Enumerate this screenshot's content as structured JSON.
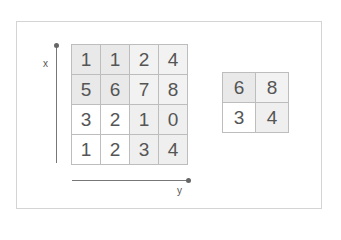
{
  "diagram": {
    "axes": {
      "vertical_label": "x",
      "horizontal_label": "y"
    },
    "input_matrix": {
      "rows": [
        [
          1,
          1,
          2,
          4
        ],
        [
          5,
          6,
          7,
          8
        ],
        [
          3,
          2,
          1,
          0
        ],
        [
          1,
          2,
          3,
          4
        ]
      ],
      "quadrant_colors": {
        "top_left": "#e9e9e9",
        "top_right": "#f2f2f2",
        "bottom_left": "#ffffff",
        "bottom_right": "#efefef"
      }
    },
    "pooled_matrix": {
      "rows": [
        [
          6,
          8
        ],
        [
          3,
          4
        ]
      ],
      "cell_colors": [
        "#e9e9e9",
        "#f2f2f2",
        "#ffffff",
        "#efefef"
      ]
    }
  }
}
